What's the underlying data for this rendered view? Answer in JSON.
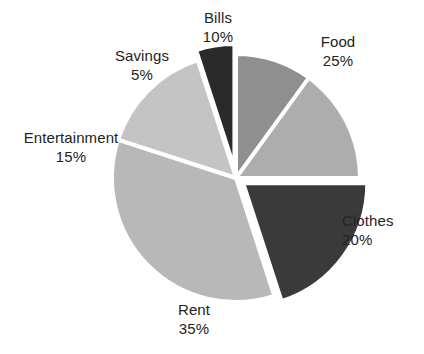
{
  "figure": {
    "background_color": "#ffffff",
    "separator_color": "#ffffff",
    "label_text_color": "#232323"
  },
  "chart_data": {
    "type": "pie",
    "title": "",
    "subtitle": "",
    "xlabel": "",
    "ylabel": "",
    "legend_position": "none",
    "grid": false,
    "units": "percent",
    "total": 100,
    "start_angle_deg": -90,
    "direction": "clockwise",
    "categories": [
      "Food",
      "Clothes",
      "Rent",
      "Entertainment",
      "Savings",
      "Bills"
    ],
    "values": [
      25,
      20,
      35,
      15,
      5,
      10
    ],
    "slices": [
      {
        "label": "Food",
        "value": 25,
        "value_text": "25%",
        "color": "#adadad",
        "exploded": false,
        "explode_offset": 0,
        "start_deg": -90,
        "end_deg": 0,
        "label_x": 338,
        "label_y": 41
      },
      {
        "label": "Clothes",
        "value": 20,
        "value_text": "20%",
        "color": "#3a3a3a",
        "exploded": true,
        "explode_offset": 9,
        "start_deg": 0,
        "end_deg": 72,
        "label_x": 381,
        "label_y": 220
      },
      {
        "label": "Rent",
        "value": 35,
        "value_text": "35%",
        "color": "#b8b8b8",
        "exploded": false,
        "explode_offset": 0,
        "start_deg": 72,
        "end_deg": 198,
        "label_x": 194,
        "label_y": 309
      },
      {
        "label": "Entertainment",
        "value": 15,
        "value_text": "15%",
        "color": "#c4c4c4",
        "exploded": false,
        "explode_offset": 0,
        "start_deg": 198,
        "end_deg": 252,
        "label_x": 71,
        "label_y": 137
      },
      {
        "label": "Savings",
        "value": 5,
        "value_text": "5%",
        "color": "#2a2a2a",
        "exploded": true,
        "explode_offset": 10,
        "start_deg": 252,
        "end_deg": 270,
        "label_x": 142,
        "label_y": 55
      },
      {
        "label": "Bills",
        "value": 10,
        "value_text": "10%",
        "color": "#8f8f8f",
        "exploded": false,
        "explode_offset": 0,
        "start_deg": 270,
        "end_deg": 306,
        "label_x": 218,
        "label_y": 17
      }
    ],
    "geometry": {
      "center_x": 236,
      "center_y": 178,
      "radius": 124
    }
  },
  "labels": {
    "food": {
      "name": "Food",
      "value": "25%"
    },
    "clothes": {
      "name": "Clothes",
      "value": "20%"
    },
    "rent": {
      "name": "Rent",
      "value": "35%"
    },
    "entertainment": {
      "name": "Entertainment",
      "value": "15%"
    },
    "savings": {
      "name": "Savings",
      "value": "5%"
    },
    "bills": {
      "name": "Bills",
      "value": "10%"
    }
  }
}
